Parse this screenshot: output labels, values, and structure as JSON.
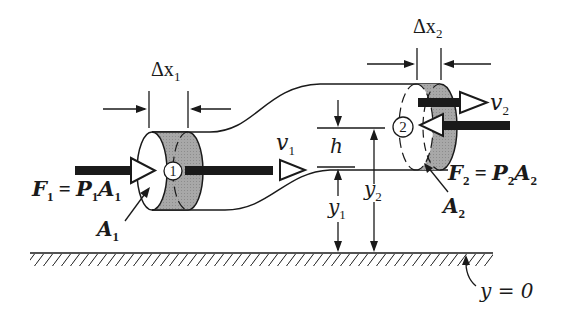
{
  "figure": {
    "colors": {
      "ink": "#1a1a1a",
      "shade": "#a8a8a8",
      "background": "#ffffff"
    }
  },
  "labels": {
    "dx1": {
      "main": "Δx",
      "sub": "1"
    },
    "dx2": {
      "main": "Δx",
      "sub": "2"
    },
    "v1": {
      "main": "v",
      "sub": "1"
    },
    "v2": {
      "main": "v",
      "sub": "2"
    },
    "h": {
      "main": "h"
    },
    "y1": {
      "main": "y",
      "sub": "1"
    },
    "y2": {
      "main": "y",
      "sub": "2"
    },
    "A1": {
      "main": "A",
      "sub": "1"
    },
    "A2": {
      "main": "A",
      "sub": "2"
    },
    "F1": {
      "f": "F",
      "fsub": "1",
      "eq": " = ",
      "p": "P",
      "psub": "1",
      "a": "A",
      "asub": "1"
    },
    "F2": {
      "f": "F",
      "fsub": "2",
      "eq": " = ",
      "p": "P",
      "psub": "2",
      "a": "A",
      "asub": "2"
    },
    "section1": "1",
    "section2": "2",
    "ground": "y = 0"
  }
}
